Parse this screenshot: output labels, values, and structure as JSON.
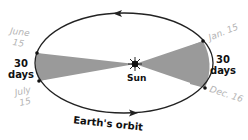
{
  "diagram": {
    "center_label": "Sun",
    "orbit_label": "Earth's orbit",
    "left_period": {
      "value": "30",
      "unit": "days",
      "start_date": "June 15",
      "end_date": "July 15",
      "start_month": "June",
      "start_day": "15",
      "end_month": "July",
      "end_day": "15"
    },
    "right_period": {
      "value": "30",
      "unit": "days",
      "start_date": "Jan. 15",
      "end_date": "Dec. 16"
    },
    "colors": {
      "orbit": "#222222",
      "wedge": "#9a9a9a",
      "date_text": "#b4b4b4",
      "label_text": "#111111"
    }
  }
}
